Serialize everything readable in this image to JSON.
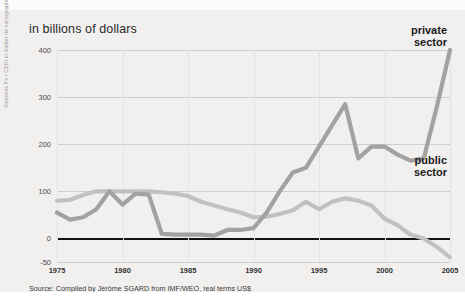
{
  "figure": {
    "title": "in billions of dollars",
    "source": "Source: Compiled by Jérôme SGARD from IMF/WEO, real terms US$",
    "credit": "Sciences Po / CERI et Atelier de cartographie, February 2008",
    "top_cut_text": "",
    "colors": {
      "background": "#f1f0ef",
      "private_line": "#a3a2a1",
      "public_line": "#c2c1c0",
      "zero_axis": "#111111",
      "gridline": "#cfcecd",
      "text": "#2a2a2a"
    }
  },
  "chart_data": {
    "type": "line",
    "title": "in billions of dollars",
    "subtitle": "",
    "xlabel": "",
    "ylabel": "in billions of dollars",
    "xlim": [
      1975,
      2005
    ],
    "ylim": [
      -50,
      400
    ],
    "yticks": [
      400,
      300,
      200,
      100,
      0,
      -50
    ],
    "xticks": [
      1975,
      1980,
      1985,
      1990,
      1995,
      2000,
      2005
    ],
    "grid": "horizontal",
    "legend": "inline-annotations",
    "annotations": [
      "private sector",
      "public sector"
    ],
    "x": [
      1975,
      1976,
      1977,
      1978,
      1979,
      1980,
      1981,
      1982,
      1983,
      1984,
      1985,
      1986,
      1987,
      1988,
      1989,
      1990,
      1991,
      1992,
      1993,
      1994,
      1995,
      1996,
      1997,
      1998,
      1999,
      2000,
      2001,
      2002,
      2003,
      2004,
      2005
    ],
    "series": [
      {
        "name": "private sector",
        "color": "#a3a2a1",
        "values": [
          55,
          40,
          45,
          62,
          100,
          72,
          95,
          93,
          10,
          8,
          8,
          8,
          6,
          18,
          18,
          22,
          55,
          100,
          140,
          150,
          195,
          240,
          285,
          170,
          195,
          195,
          178,
          165,
          170,
          280,
          400
        ]
      },
      {
        "name": "public sector",
        "color": "#c2c1c0",
        "values": [
          80,
          82,
          92,
          100,
          100,
          100,
          100,
          100,
          98,
          95,
          90,
          78,
          70,
          62,
          55,
          45,
          46,
          52,
          60,
          78,
          62,
          78,
          85,
          80,
          70,
          42,
          28,
          8,
          0,
          -18,
          -40
        ]
      }
    ]
  },
  "axis": {
    "y_tick_labels": [
      "400",
      "300",
      "200",
      "100",
      "0",
      "-50"
    ],
    "x_tick_labels": [
      "1975",
      "1980",
      "1985",
      "1990",
      "1995",
      "2000",
      "2005"
    ]
  },
  "labels": {
    "private_line1": "private",
    "private_line2": "sector",
    "public_line1": "public",
    "public_line2": "sector"
  }
}
